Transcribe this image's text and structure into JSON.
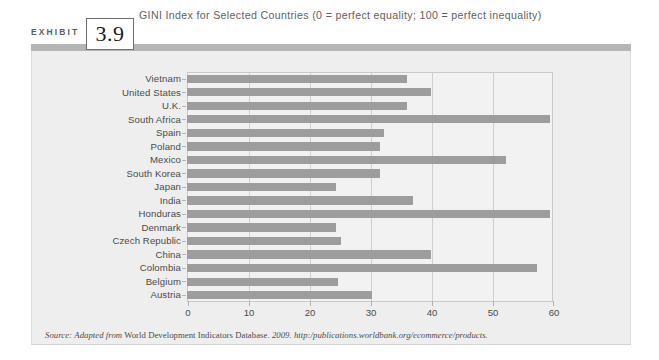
{
  "exhibit": {
    "label": "EXHIBIT",
    "number": "3.9"
  },
  "chart_title": "GINI Index for Selected Countries (0 = perfect equality; 100 = perfect inequality)",
  "source": {
    "prefix": "Source:",
    "adapted": "Adapted from",
    "body": "World Development Indicators Database.",
    "year": "2009.",
    "url": "http:/publications.worldbank.org/ecommerce/products."
  },
  "colors": {
    "bar": "#9d9d9d",
    "panel_bg": "#eeeeee",
    "plot_bg": "#f2f2f2",
    "grid": "#cfcfcf",
    "header_rule": "#b5b5b5",
    "text": "#4a4a4a",
    "title_text": "#5f5f5f"
  },
  "chart_data": {
    "type": "bar",
    "orientation": "horizontal",
    "title": "GINI Index for Selected Countries (0 = perfect equality; 100 = perfect inequality)",
    "xlabel": "",
    "ylabel": "",
    "xlim": [
      0,
      60
    ],
    "xticks": [
      0,
      10,
      20,
      30,
      40,
      50,
      60
    ],
    "grid": true,
    "legend": "none",
    "categories": [
      "Vietnam",
      "United States",
      "U.K.",
      "South Africa",
      "Spain",
      "Poland",
      "Mexico",
      "South Korea",
      "Japan",
      "India",
      "Honduras",
      "Denmark",
      "Czech Republic",
      "China",
      "Colombia",
      "Belgium",
      "Austria"
    ],
    "values": [
      36,
      40,
      36,
      59.5,
      32.3,
      31.6,
      52.3,
      31.6,
      24.4,
      37,
      59.5,
      24.5,
      25.2,
      40,
      57.3,
      24.7,
      30.3
    ]
  }
}
